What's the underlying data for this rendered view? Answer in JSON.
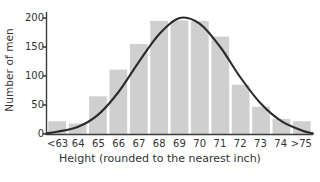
{
  "chart_data": {
    "type": "bar",
    "title": "",
    "xlabel": "Height (rounded to the nearest inch)",
    "ylabel": "Number of men",
    "categories": [
      "<63",
      "64",
      "65",
      "66",
      "67",
      "68",
      "69",
      "70",
      "71",
      "72",
      "73",
      "74",
      ">75"
    ],
    "values": [
      22,
      18,
      65,
      111,
      155,
      195,
      196,
      195,
      168,
      85,
      47,
      26,
      22
    ],
    "series": [
      {
        "name": "Number of men",
        "values": [
          22,
          18,
          65,
          111,
          155,
          195,
          196,
          195,
          168,
          85,
          47,
          26,
          22
        ]
      }
    ],
    "overlay_curve": {
      "name": "normal curve",
      "type": "line",
      "mean_category": "69",
      "peak_value": 200,
      "points": [
        {
          "x": "<63",
          "y": 4
        },
        {
          "x": "64",
          "y": 12
        },
        {
          "x": "65",
          "y": 33
        },
        {
          "x": "66",
          "y": 72
        },
        {
          "x": "67",
          "y": 124
        },
        {
          "x": "68",
          "y": 172
        },
        {
          "x": "69",
          "y": 200
        },
        {
          "x": "70",
          "y": 190
        },
        {
          "x": "71",
          "y": 150
        },
        {
          "x": "72",
          "y": 97
        },
        {
          "x": "73",
          "y": 52
        },
        {
          "x": "74",
          "y": 22
        },
        {
          "x": ">75",
          "y": 6
        }
      ]
    },
    "ylim": [
      0,
      210
    ],
    "yticks": [
      0,
      50,
      100,
      150,
      200
    ],
    "ytick_labels": [
      "0",
      "50",
      "100",
      "150",
      "200"
    ],
    "grid": false,
    "legend": "none",
    "colors": {
      "bar_fill": "#cfcfcf",
      "curve": "#2b2b2b",
      "axis": "#3a3a3a",
      "text": "#333333",
      "background": "#ffffff"
    }
  }
}
